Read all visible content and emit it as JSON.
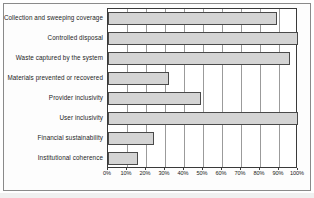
{
  "chart_data": {
    "type": "bar",
    "orientation": "horizontal",
    "title": "",
    "subtitle": "",
    "xlabel": "",
    "ylabel": "",
    "xlim": [
      0,
      100
    ],
    "grid": true,
    "legend": "none",
    "tick_labels": [
      "0%",
      "10%",
      "20%",
      "30%",
      "40%",
      "50%",
      "60%",
      "70%",
      "80%",
      "90%",
      "100%"
    ],
    "tick_values": [
      0,
      10,
      20,
      30,
      40,
      50,
      60,
      70,
      80,
      90,
      100
    ],
    "categories": [
      "Collection and sweeping coverage",
      "Controlled disposal",
      "Waste captured by the system",
      "Materials prevented or recovered",
      "Provider inclusivity",
      "User inclusivity",
      "Financial sustainability",
      "Institutional coherence"
    ],
    "values": [
      89,
      100,
      96,
      32,
      49,
      100,
      24,
      16
    ],
    "value_unit": "%",
    "bar_fill_color": "#d4d4d4",
    "bar_edge_color": "#4a4a4a",
    "plot_border_color": "#3a3a3a",
    "gridline_color": "#9b9b9b",
    "background_color": "#ffffff"
  }
}
